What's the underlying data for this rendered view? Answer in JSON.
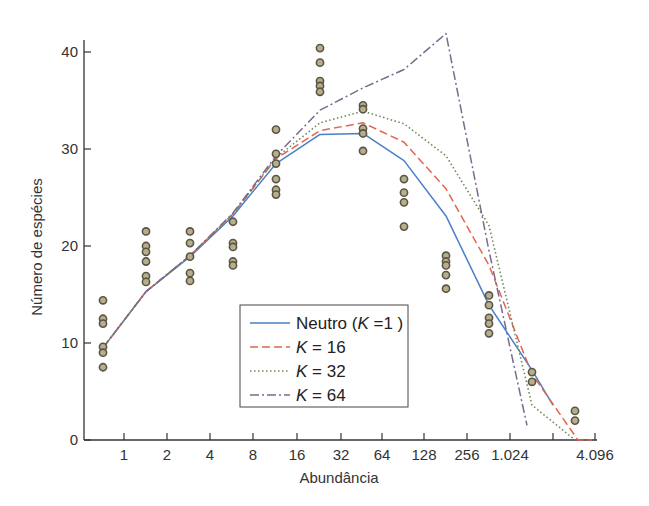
{
  "chart_data": {
    "type": "line",
    "title": "",
    "xlabel": "Abundância",
    "ylabel": "Número de espécies",
    "ylim": [
      0,
      42
    ],
    "yticks": [
      0,
      10,
      20,
      30,
      40
    ],
    "xticks": [
      "1",
      "2",
      "4",
      "8",
      "16",
      "32",
      "64",
      "128",
      "256",
      "1.024",
      "",
      "4.096"
    ],
    "grid": false,
    "legend_position": "lower center (inside plot)",
    "categories": [
      "bin1",
      "bin2",
      "bin3",
      "bin4",
      "bin5",
      "bin6",
      "bin7",
      "bin8",
      "bin9",
      "bin10",
      "bin11",
      "bin12"
    ],
    "observed_points": [
      {
        "bin": 1,
        "values": [
          14.4,
          12.5,
          12.0,
          9.6,
          9.0,
          7.5
        ]
      },
      {
        "bin": 2,
        "values": [
          21.5,
          20.0,
          19.4,
          18.4,
          16.9,
          16.3
        ]
      },
      {
        "bin": 3,
        "values": [
          21.5,
          20.3,
          18.9,
          17.2,
          16.4
        ]
      },
      {
        "bin": 4,
        "values": [
          22.5,
          20.3,
          19.9,
          18.4,
          18.0
        ]
      },
      {
        "bin": 5,
        "values": [
          32.0,
          29.5,
          28.5,
          26.9,
          25.8,
          25.3
        ]
      },
      {
        "bin": 6,
        "values": [
          40.4,
          38.9,
          37.0,
          36.5,
          35.9
        ]
      },
      {
        "bin": 7,
        "values": [
          34.5,
          34.1,
          32.1,
          31.6,
          29.8
        ]
      },
      {
        "bin": 8,
        "values": [
          26.9,
          25.5,
          24.5,
          22.0
        ]
      },
      {
        "bin": 9,
        "values": [
          19.0,
          18.4,
          18.0,
          17.0,
          15.6
        ]
      },
      {
        "bin": 10,
        "values": [
          14.9,
          13.9,
          12.6,
          12.0,
          11.0
        ]
      },
      {
        "bin": 11,
        "values": [
          7.0,
          6.0
        ]
      },
      {
        "bin": 12,
        "values": [
          3.0,
          2.0
        ]
      }
    ],
    "series": [
      {
        "name": "Neutro (K =1 )",
        "style": "solid",
        "color": "#4a7fc8",
        "values": [
          9.5,
          15.3,
          18.9,
          23.1,
          28.5,
          31.5,
          31.6,
          28.8,
          23.1,
          13.9,
          7.2,
          3.6
        ]
      },
      {
        "name": "K = 16",
        "style": "dashed",
        "color": "#e2664f",
        "values": [
          9.5,
          15.3,
          19.0,
          23.3,
          29.0,
          31.9,
          32.7,
          30.7,
          25.9,
          18.0,
          6.8,
          0.0
        ]
      },
      {
        "name": "K = 32",
        "style": "dotted",
        "color": "#6e8a5a",
        "values": [
          9.5,
          15.3,
          19.0,
          23.3,
          29.1,
          32.7,
          33.9,
          32.6,
          29.3,
          22.1,
          3.6,
          0.0
        ]
      },
      {
        "name": "K = 64",
        "style": "dashdot",
        "color": "#7a6a8c",
        "values": [
          9.5,
          15.3,
          19.0,
          23.4,
          29.3,
          34.0,
          36.3,
          38.2,
          41.9,
          19.5,
          1.5,
          null
        ]
      }
    ]
  },
  "legend": {
    "items": [
      {
        "prefix": "Neutro (",
        "italic": "K",
        "suffix": " =1 )"
      },
      {
        "prefix": "",
        "italic": "K",
        "suffix": " = 16"
      },
      {
        "prefix": "",
        "italic": "K",
        "suffix": " = 32"
      },
      {
        "prefix": "",
        "italic": "K",
        "suffix": " = 64"
      }
    ]
  },
  "colors": {
    "axis": "#333333",
    "marker_fill": "#b9ae8c",
    "marker_stroke": "#5a5646"
  }
}
